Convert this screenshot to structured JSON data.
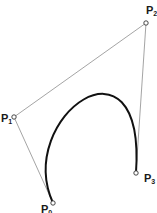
{
  "diagram": {
    "type": "cubic-bezier",
    "points": [
      {
        "id": "P0",
        "label": "P",
        "sub": "0",
        "x": 53,
        "y": 203,
        "label_x": 41,
        "label_y": 213
      },
      {
        "id": "P1",
        "label": "P",
        "sub": "1",
        "x": 14,
        "y": 117,
        "label_x": 1,
        "label_y": 122
      },
      {
        "id": "P2",
        "label": "P",
        "sub": "2",
        "x": 146,
        "y": 23,
        "label_x": 146,
        "label_y": 14
      },
      {
        "id": "P3",
        "label": "P",
        "sub": "3",
        "x": 136,
        "y": 173,
        "label_x": 144,
        "label_y": 182
      }
    ],
    "colors": {
      "curve": "#111111",
      "control_polygon": "#9a9a9a",
      "point_fill": "#ffffff",
      "point_stroke": "#333333"
    }
  }
}
